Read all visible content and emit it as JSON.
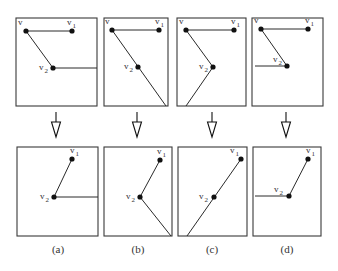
{
  "figure": {
    "panels": [
      {
        "id": "a",
        "caption": "(a)",
        "caption_pos": [
          58,
          253
        ],
        "before": {
          "frame": [
            16,
            18,
            97,
            106
          ],
          "nodes": [
            {
              "name": "v",
              "label": "v",
              "sub": "",
              "x": 26,
              "y": 31,
              "lx": 18,
              "ly": 25
            },
            {
              "name": "v1",
              "label": "v",
              "sub": "1",
              "x": 72,
              "y": 31,
              "lx": 67,
              "ly": 25
            },
            {
              "name": "v2",
              "label": "v",
              "sub": "2",
              "x": 53,
              "y": 68,
              "lx": 39,
              "ly": 70
            }
          ],
          "edges": [
            [
              26,
              31,
              72,
              31
            ],
            [
              26,
              31,
              53,
              68
            ],
            [
              53,
              68,
              97,
              68
            ]
          ]
        },
        "arrow": {
          "x": 56,
          "y1": 112,
          "y2": 137
        },
        "after": {
          "frame": [
            17,
            147,
            98,
            236
          ],
          "nodes": [
            {
              "name": "v1",
              "label": "v",
              "sub": "1",
              "x": 72,
              "y": 159,
              "lx": 70,
              "ly": 153
            },
            {
              "name": "v2",
              "label": "v",
              "sub": "2",
              "x": 54,
              "y": 197,
              "lx": 40,
              "ly": 199
            }
          ],
          "edges": [
            [
              72,
              159,
              54,
              197
            ],
            [
              54,
              197,
              98,
              197
            ]
          ]
        }
      },
      {
        "id": "b",
        "caption": "(b)",
        "caption_pos": [
          138,
          253
        ],
        "before": {
          "frame": [
            104,
            18,
            168,
            106
          ],
          "nodes": [
            {
              "name": "v",
              "label": "v",
              "sub": "",
              "x": 112,
              "y": 30,
              "lx": 105,
              "ly": 24
            },
            {
              "name": "v1",
              "label": "v",
              "sub": "1",
              "x": 159,
              "y": 30,
              "lx": 155,
              "ly": 24
            },
            {
              "name": "v2",
              "label": "v",
              "sub": "2",
              "x": 138,
              "y": 67,
              "lx": 124,
              "ly": 69
            }
          ],
          "edges": [
            [
              112,
              30,
              159,
              30
            ],
            [
              112,
              30,
              166,
              106
            ]
          ]
        },
        "arrow": {
          "x": 137,
          "y1": 112,
          "y2": 137
        },
        "after": {
          "frame": [
            104,
            147,
            172,
            236
          ],
          "nodes": [
            {
              "name": "v1",
              "label": "v",
              "sub": "1",
              "x": 160,
              "y": 160,
              "lx": 157,
              "ly": 154
            },
            {
              "name": "v2",
              "label": "v",
              "sub": "2",
              "x": 140,
              "y": 197,
              "lx": 126,
              "ly": 199
            }
          ],
          "edges": [
            [
              160,
              160,
              140,
              197
            ],
            [
              140,
              197,
              171,
              236
            ]
          ]
        }
      },
      {
        "id": "c",
        "caption": "(c)",
        "caption_pos": [
          212,
          253
        ],
        "before": {
          "frame": [
            177,
            18,
            246,
            106
          ],
          "nodes": [
            {
              "name": "v",
              "label": "v",
              "sub": "",
              "x": 186,
              "y": 30,
              "lx": 179,
              "ly": 24
            },
            {
              "name": "v1",
              "label": "v",
              "sub": "1",
              "x": 234,
              "y": 30,
              "lx": 231,
              "ly": 24
            },
            {
              "name": "v2",
              "label": "v",
              "sub": "2",
              "x": 213,
              "y": 67,
              "lx": 199,
              "ly": 69
            }
          ],
          "edges": [
            [
              186,
              30,
              234,
              30
            ],
            [
              186,
              30,
              213,
              67
            ],
            [
              213,
              67,
              186,
              106
            ]
          ]
        },
        "arrow": {
          "x": 212,
          "y1": 112,
          "y2": 137
        },
        "after": {
          "frame": [
            178,
            147,
            247,
            236
          ],
          "nodes": [
            {
              "name": "v1",
              "label": "v",
              "sub": "1",
              "x": 241,
              "y": 159,
              "lx": 230,
              "ly": 153
            },
            {
              "name": "v2",
              "label": "v",
              "sub": "2",
              "x": 214,
              "y": 197,
              "lx": 199,
              "ly": 199
            }
          ],
          "edges": [
            [
              241,
              159,
              187,
              236
            ]
          ]
        }
      },
      {
        "id": "d",
        "caption": "(d)",
        "caption_pos": [
          287,
          253
        ],
        "before": {
          "frame": [
            252,
            18,
            323,
            106
          ],
          "nodes": [
            {
              "name": "v",
              "label": "v",
              "sub": "",
              "x": 261,
              "y": 29,
              "lx": 254,
              "ly": 23
            },
            {
              "name": "v1",
              "label": "v",
              "sub": "1",
              "x": 308,
              "y": 29,
              "lx": 305,
              "ly": 23
            },
            {
              "name": "v2",
              "label": "v",
              "sub": "2",
              "x": 287,
              "y": 66,
              "lx": 273,
              "ly": 62
            }
          ],
          "edges": [
            [
              261,
              29,
              308,
              29
            ],
            [
              261,
              29,
              287,
              66
            ],
            [
              255,
              66,
              287,
              66
            ]
          ]
        },
        "arrow": {
          "x": 286,
          "y1": 112,
          "y2": 137
        },
        "after": {
          "frame": [
            253,
            147,
            321,
            236
          ],
          "nodes": [
            {
              "name": "v1",
              "label": "v",
              "sub": "1",
              "x": 308,
              "y": 159,
              "lx": 306,
              "ly": 153
            },
            {
              "name": "v2",
              "label": "v",
              "sub": "2",
              "x": 289,
              "y": 196,
              "lx": 274,
              "ly": 192
            }
          ],
          "edges": [
            [
              308,
              159,
              289,
              196
            ],
            [
              255,
              196,
              289,
              196
            ]
          ]
        }
      }
    ]
  }
}
